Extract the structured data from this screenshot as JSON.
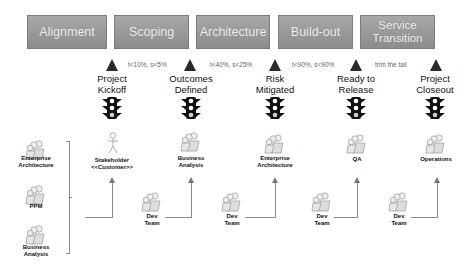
{
  "phases": [
    {
      "label": "Alignment"
    },
    {
      "label": "Scoping"
    },
    {
      "label": "Architecture"
    },
    {
      "label": "Build-out"
    },
    {
      "label": "Service\nTransition"
    }
  ],
  "milestones": [
    {
      "label": "Project\nKickoff",
      "role": "Stakeholder\n<<Customer>>",
      "role_icon": "stick-figure-icon"
    },
    {
      "label": "Outcomes\nDefined",
      "role": "Business\nAnalysis",
      "role_icon": "people-group-icon"
    },
    {
      "label": "Risk\nMitigated",
      "role": "Enterprise\nArchitecture",
      "role_icon": "people-group-icon"
    },
    {
      "label": "Ready to\nRelease",
      "role": "QA",
      "role_icon": "people-group-icon"
    },
    {
      "label": "Project\nCloseout",
      "role": "Operations",
      "role_icon": "people-group-icon"
    }
  ],
  "criteria": [
    "t<10%, s<5%",
    "t<40%, s<25%",
    "t<90%, s<90%",
    "trim the tail"
  ],
  "left_group": [
    {
      "label": "Enterprise\nArchitecture"
    },
    {
      "label": "PPM"
    },
    {
      "label": "Business\nAnalysis"
    }
  ],
  "dev_teams": [
    {
      "label": "Dev\nTeam"
    },
    {
      "label": "Dev\nTeam"
    },
    {
      "label": "Dev\nTeam"
    },
    {
      "label": "Dev\nTeam"
    }
  ],
  "colors": {
    "phase_fill": "#999999",
    "milestone": "#2b2b2b",
    "connector": "#8a8a8a"
  }
}
